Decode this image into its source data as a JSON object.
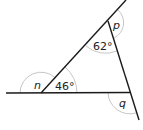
{
  "diagram": {
    "type": "geometry-angles",
    "colors": {
      "line": "#1a1a1a",
      "arc": "#b5b5b5",
      "text": "#222222"
    },
    "angles": [
      {
        "id": "n",
        "label": "n",
        "kind": "exterior"
      },
      {
        "id": "a46",
        "label": "46°",
        "kind": "interior"
      },
      {
        "id": "a62",
        "label": "62°",
        "kind": "interior"
      },
      {
        "id": "p",
        "label": "p",
        "kind": "exterior"
      },
      {
        "id": "q",
        "label": "q",
        "kind": "exterior"
      }
    ]
  }
}
